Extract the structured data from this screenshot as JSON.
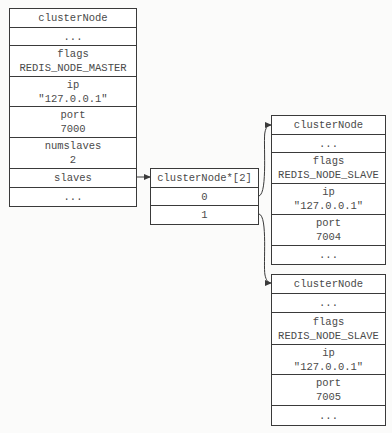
{
  "master_node": {
    "title": "clusterNode",
    "rows": [
      {
        "label": "..."
      },
      {
        "label": "flags",
        "value": "REDIS_NODE_MASTER"
      },
      {
        "label": "ip",
        "value": "\"127.0.0.1\""
      },
      {
        "label": "port",
        "value": "7000"
      },
      {
        "label": "numslaves",
        "value": "2"
      },
      {
        "label": "slaves"
      },
      {
        "label": "..."
      }
    ]
  },
  "slaves_array": {
    "title": "clusterNode*[2]",
    "slots": [
      "0",
      "1"
    ]
  },
  "slave_nodes": [
    {
      "title": "clusterNode",
      "rows": [
        {
          "label": "..."
        },
        {
          "label": "flags",
          "value": "REDIS_NODE_SLAVE"
        },
        {
          "label": "ip",
          "value": "\"127.0.0.1\""
        },
        {
          "label": "port",
          "value": "7004"
        },
        {
          "label": "..."
        }
      ]
    },
    {
      "title": "clusterNode",
      "rows": [
        {
          "label": "..."
        },
        {
          "label": "flags",
          "value": "REDIS_NODE_SLAVE"
        },
        {
          "label": "ip",
          "value": "\"127.0.0.1\""
        },
        {
          "label": "port",
          "value": "7005"
        },
        {
          "label": "..."
        }
      ]
    }
  ],
  "colors": {
    "line": "#3a3a3a",
    "text": "#4a4a4a",
    "background": "#fbfbfa"
  }
}
